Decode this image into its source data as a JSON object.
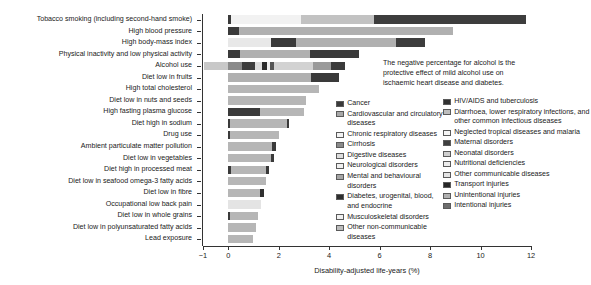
{
  "chart_data": {
    "type": "bar",
    "orientation": "horizontal",
    "stacked": true,
    "title": "",
    "xlabel": "Disability-adjusted life-years (%)",
    "ylabel": "",
    "xlim": [
      -1,
      12
    ],
    "xticks": [
      -1,
      0,
      2,
      4,
      6,
      8,
      10,
      12
    ],
    "xticklabels": [
      "−1",
      "0",
      "2",
      "4",
      "6",
      "8",
      "10",
      "12"
    ],
    "grid": false,
    "legend_position": "inside-right",
    "annotation": "The negative percentage for alcohol is the protective effect of mild alcohol use on ischaemic heart disease and diabetes.",
    "categories": [
      "Tobacco smoking (including second-hand smoke)",
      "High blood pressure",
      "High body-mass index",
      "Physical inactivity and low physical activity",
      "Alcohol use",
      "Diet low in fruits",
      "High total cholesterol",
      "Diet low in nuts and seeds",
      "High fasting plasma glucose",
      "Diet high in sodium",
      "Drug use",
      "Ambient particulate matter pollution",
      "Diet low in vegetables",
      "Diet high in processed meat",
      "Diet low in seafood omega-3 fatty acids",
      "Diet low in fibre",
      "Occupational low back pain",
      "Diet low in whole grains",
      "Diet low in polyunsaturated fatty acids",
      "Lead exposure"
    ],
    "totals": [
      11.8,
      8.9,
      7.8,
      5.2,
      4.6,
      4.4,
      3.6,
      3.1,
      3.0,
      2.4,
      2.0,
      1.9,
      1.8,
      1.6,
      1.5,
      1.4,
      1.3,
      1.2,
      1.1,
      1.0
    ],
    "negative_totals": [
      0,
      0,
      0,
      0,
      -0.95,
      0,
      0,
      0,
      0,
      0,
      0,
      0,
      0,
      0,
      0,
      0,
      0,
      0,
      0,
      0
    ],
    "series": [
      {
        "name": "Cancer",
        "color": "#3a3a3a",
        "key": "cancer"
      },
      {
        "name": "Cardiovascular and circulatory diseases",
        "color": "#a8a8a8",
        "key": "cardiovascular"
      },
      {
        "name": "Chronic respiratory diseases",
        "color": "#f0f0f0",
        "key": "chronic_respiratory"
      },
      {
        "name": "Cirrhosis",
        "color": "#7d7d7d",
        "key": "cirrhosis"
      },
      {
        "name": "Digestive diseases",
        "color": "#d9d9d9",
        "key": "digestive"
      },
      {
        "name": "Neurological disorders",
        "color": "#ececec",
        "key": "neurological"
      },
      {
        "name": "Mental and behavioural disorders",
        "color": "#9b9b9b",
        "key": "mental"
      },
      {
        "name": "Diabetes, urogenital, blood, and endocrine",
        "color": "#2e2e2e",
        "key": "diabetes"
      },
      {
        "name": "Musculoskeletal disorders",
        "color": "#efefef",
        "key": "musculoskeletal"
      },
      {
        "name": "Other non-communicable diseases",
        "color": "#b4b4b4",
        "key": "other_ncd"
      },
      {
        "name": "HIV/AIDS and tuberculosis",
        "color": "#303030",
        "key": "hiv_tb"
      },
      {
        "name": "Diarrhoea, lower respiratory infections, and other common infectious diseases",
        "color": "#bdbdbd",
        "key": "diarrhoea"
      },
      {
        "name": "Neglected tropical diseases and malaria",
        "color": "#f4f4f4",
        "key": "tropical"
      },
      {
        "name": "Maternal disorders",
        "color": "#444444",
        "key": "maternal"
      },
      {
        "name": "Neonatal disorders",
        "color": "#cfcfcf",
        "key": "neonatal"
      },
      {
        "name": "Nutritional deficiencies",
        "color": "#ededed",
        "key": "nutritional"
      },
      {
        "name": "Other communicable diseases",
        "color": "#e2e2e2",
        "key": "other_comm"
      },
      {
        "name": "Transport injuries",
        "color": "#262626",
        "key": "transport"
      },
      {
        "name": "Unintentional injuries",
        "color": "#b0b0b0",
        "key": "unintentional"
      },
      {
        "name": "Intentional injuries",
        "color": "#6e6e6e",
        "key": "intentional"
      }
    ],
    "bars": [
      {
        "category": "Tobacco smoking (including second-hand smoke)",
        "total": 11.8,
        "segments": [
          {
            "key": "transport",
            "value": 0.12,
            "color": "#3a3a3a"
          },
          {
            "key": "chronic_respiratory",
            "value": 2.75,
            "color": "#f2f2f2"
          },
          {
            "key": "cardiovascular",
            "value": 2.9,
            "color": "#c2c2c2"
          },
          {
            "key": "cancer",
            "value": 6.03,
            "color": "#3d3d3d"
          }
        ]
      },
      {
        "category": "High blood pressure",
        "total": 8.9,
        "segments": [
          {
            "key": "cancer",
            "value": 0.42,
            "color": "#3a3a3a"
          },
          {
            "key": "cardiovascular",
            "value": 8.48,
            "color": "#b0b0b0"
          }
        ]
      },
      {
        "category": "High body-mass index",
        "total": 7.8,
        "segments": [
          {
            "key": "chronic_respiratory",
            "value": 1.7,
            "color": "#e8e8e8"
          },
          {
            "key": "diabetes",
            "value": 1.0,
            "color": "#3a3a3a"
          },
          {
            "key": "cardiovascular",
            "value": 3.95,
            "color": "#b0b0b0"
          },
          {
            "key": "cancer",
            "value": 1.15,
            "color": "#3d3d3d"
          }
        ]
      },
      {
        "category": "Physical inactivity and low physical activity",
        "total": 5.2,
        "segments": [
          {
            "key": "cancer",
            "value": 0.45,
            "color": "#3a3a3a"
          },
          {
            "key": "cardiovascular",
            "value": 2.8,
            "color": "#b0b0b0"
          },
          {
            "key": "diabetes",
            "value": 1.95,
            "color": "#3a3a3a"
          }
        ]
      },
      {
        "category": "Alcohol use",
        "total": 4.6,
        "negative": -0.95,
        "neg_segments": [
          {
            "key": "cardiovascular",
            "value": 0.95,
            "color": "#c8c8c8"
          }
        ],
        "segments": [
          {
            "key": "cirrhosis",
            "value": 0.55,
            "color": "#8a8a8a"
          },
          {
            "key": "cancer",
            "value": 0.5,
            "color": "#3d3d3d"
          },
          {
            "key": "digestive",
            "value": 0.3,
            "color": "#dcdcdc"
          },
          {
            "key": "transport",
            "value": 0.2,
            "color": "#2a2a2a"
          },
          {
            "key": "neurological",
            "value": 0.12,
            "color": "#efefef"
          },
          {
            "key": "intentional",
            "value": 0.15,
            "color": "#555555"
          },
          {
            "key": "mental",
            "value": 1.55,
            "color": "#d2d2d2"
          },
          {
            "key": "unintentional",
            "value": 0.7,
            "color": "#9a9a9a"
          },
          {
            "key": "other",
            "value": 0.55,
            "color": "#3a3a3a"
          }
        ]
      },
      {
        "category": "Diet low in fruits",
        "total": 4.4,
        "segments": [
          {
            "key": "cardiovascular",
            "value": 3.3,
            "color": "#b0b0b0"
          },
          {
            "key": "cancer",
            "value": 1.1,
            "color": "#3a3a3a"
          }
        ]
      },
      {
        "category": "High total cholesterol",
        "total": 3.6,
        "segments": [
          {
            "key": "cardiovascular",
            "value": 3.6,
            "color": "#b6b6b6"
          }
        ]
      },
      {
        "category": "Diet low in nuts and seeds",
        "total": 3.1,
        "segments": [
          {
            "key": "cardiovascular",
            "value": 3.1,
            "color": "#b6b6b6"
          }
        ]
      },
      {
        "category": "High fasting plasma glucose",
        "total": 3.0,
        "segments": [
          {
            "key": "diabetes",
            "value": 1.25,
            "color": "#3a3a3a"
          },
          {
            "key": "cardiovascular",
            "value": 1.75,
            "color": "#b6b6b6"
          }
        ]
      },
      {
        "category": "Diet high in sodium",
        "total": 2.4,
        "segments": [
          {
            "key": "transport",
            "value": 0.08,
            "color": "#3a3a3a"
          },
          {
            "key": "cardiovascular",
            "value": 2.24,
            "color": "#b6b6b6"
          },
          {
            "key": "cancer",
            "value": 0.08,
            "color": "#3a3a3a"
          }
        ]
      },
      {
        "category": "Drug use",
        "total": 2.0,
        "segments": [
          {
            "key": "transport",
            "value": 0.08,
            "color": "#3a3a3a"
          },
          {
            "key": "mental",
            "value": 1.92,
            "color": "#b6b6b6"
          }
        ]
      },
      {
        "category": "Ambient particulate matter pollution",
        "total": 1.9,
        "segments": [
          {
            "key": "cardiovascular",
            "value": 1.75,
            "color": "#b6b6b6"
          },
          {
            "key": "cancer",
            "value": 0.15,
            "color": "#3a3a3a"
          }
        ]
      },
      {
        "category": "Diet low in vegetables",
        "total": 1.8,
        "segments": [
          {
            "key": "cardiovascular",
            "value": 1.7,
            "color": "#b6b6b6"
          },
          {
            "key": "cancer",
            "value": 0.1,
            "color": "#3a3a3a"
          }
        ]
      },
      {
        "category": "Diet high in processed meat",
        "total": 1.6,
        "segments": [
          {
            "key": "transport",
            "value": 0.1,
            "color": "#3a3a3a"
          },
          {
            "key": "cardiovascular",
            "value": 1.38,
            "color": "#b6b6b6"
          },
          {
            "key": "cancer",
            "value": 0.12,
            "color": "#3a3a3a"
          }
        ]
      },
      {
        "category": "Diet low in seafood omega-3 fatty acids",
        "total": 1.5,
        "segments": [
          {
            "key": "cardiovascular",
            "value": 1.5,
            "color": "#b6b6b6"
          }
        ]
      },
      {
        "category": "Diet low in fibre",
        "total": 1.4,
        "segments": [
          {
            "key": "cardiovascular",
            "value": 1.27,
            "color": "#b6b6b6"
          },
          {
            "key": "cancer",
            "value": 0.13,
            "color": "#303030"
          }
        ]
      },
      {
        "category": "Occupational low back pain",
        "total": 1.3,
        "segments": [
          {
            "key": "musculoskeletal",
            "value": 1.3,
            "color": "#e4e4e4"
          }
        ]
      },
      {
        "category": "Diet low in whole grains",
        "total": 1.2,
        "segments": [
          {
            "key": "transport",
            "value": 0.08,
            "color": "#3a3a3a"
          },
          {
            "key": "cardiovascular",
            "value": 1.12,
            "color": "#b6b6b6"
          }
        ]
      },
      {
        "category": "Diet low in polyunsaturated fatty acids",
        "total": 1.1,
        "segments": [
          {
            "key": "cardiovascular",
            "value": 1.1,
            "color": "#b6b6b6"
          }
        ]
      },
      {
        "category": "Lead exposure",
        "total": 1.0,
        "segments": [
          {
            "key": "cardiovascular",
            "value": 1.0,
            "color": "#b6b6b6"
          }
        ]
      }
    ]
  },
  "axis": {
    "xlabel": "Disability-adjusted life-years (%)",
    "xticklabels": [
      "−1",
      "0",
      "2",
      "4",
      "6",
      "8",
      "10",
      "12"
    ]
  },
  "annotation": {
    "line1": "The negative percentage for alcohol is the",
    "line2": "protective effect of mild alcohol use on",
    "line3": "ischaemic heart disease and diabetes."
  },
  "legend": {
    "left": [
      {
        "label": "Cancer",
        "color": "#3a3a3a"
      },
      {
        "label": "Cardiovascular and circulatory diseases",
        "color": "#a8a8a8"
      },
      {
        "label": "Chronic respiratory diseases",
        "color": "#f3f3f3"
      },
      {
        "label": "Cirrhosis",
        "color": "#8a8a8a"
      },
      {
        "label": "Digestive diseases",
        "color": "#dcdcdc"
      },
      {
        "label": "Neurological disorders",
        "color": "#efefef"
      },
      {
        "label": "Mental and behavioural disorders",
        "color": "#a5a5a5"
      },
      {
        "label": "Diabetes, urogenital, blood, and endocrine",
        "color": "#2e2e2e"
      },
      {
        "label": "Musculoskeletal disorders",
        "color": "#f0f0f0"
      },
      {
        "label": "Other non-communicable diseases",
        "color": "#bcbcbc"
      }
    ],
    "right": [
      {
        "label": "HIV/AIDS and tuberculosis",
        "color": "#303030"
      },
      {
        "label": "Diarrhoea, lower respiratory infections, and other common infectious diseases",
        "color": "#bdbdbd"
      },
      {
        "label": "Neglected tropical diseases and malaria",
        "color": "#f6f6f6"
      },
      {
        "label": "Maternal disorders",
        "color": "#3f3f3f"
      },
      {
        "label": "Neonatal disorders",
        "color": "#cfcfcf"
      },
      {
        "label": "Nutritional deficiencies",
        "color": "#ededed"
      },
      {
        "label": "Other communicable diseases",
        "color": "#e4e4e4"
      },
      {
        "label": "Transport injuries",
        "color": "#262626"
      },
      {
        "label": "Unintentional injuries",
        "color": "#b0b0b0"
      },
      {
        "label": "Intentional injuries",
        "color": "#6e6e6e"
      }
    ]
  }
}
